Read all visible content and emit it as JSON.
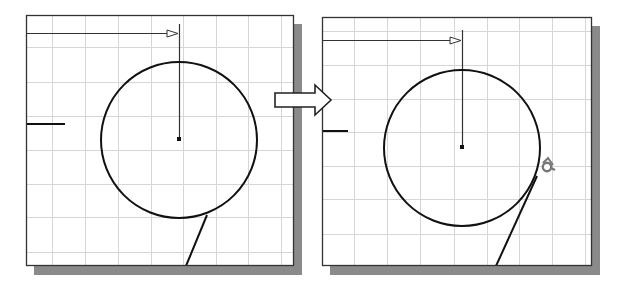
{
  "figure": {
    "colors": {
      "background": "#ffffff",
      "frame": "#333333",
      "shadow": "#8a8a8a",
      "grid": "#d6d6d6",
      "geometry": "#111111",
      "cursor": "#777777"
    },
    "panels": [
      {
        "id": "before",
        "frame": {
          "x": 26,
          "y": 15,
          "w": 268,
          "h": 251
        },
        "grid_x": [
          52,
          85,
          118,
          151,
          183,
          216,
          248,
          281
        ],
        "grid_y": [
          47,
          82,
          116,
          150,
          184,
          217,
          252
        ],
        "circle": {
          "cx": 179,
          "cy": 140,
          "r": 78
        },
        "center_point": {
          "x": 179,
          "y": 139
        },
        "leader": {
          "y": 33,
          "x1": 26,
          "x2": 179,
          "vertical_top": 24
        },
        "edge_line": {
          "y": 124,
          "x1": 26,
          "x2": 65
        },
        "tangent_line": {
          "x1": 207,
          "y1": 215,
          "x2": 186,
          "y2": 266
        },
        "cursor": null
      },
      {
        "id": "after",
        "frame": {
          "x": 322,
          "y": 17,
          "w": 270,
          "h": 249
        },
        "grid_x": [
          354,
          387,
          420,
          454,
          487,
          519,
          552,
          585
        ],
        "grid_y": [
          31,
          65,
          99,
          132,
          166,
          199,
          234
        ],
        "circle": {
          "cx": 462,
          "cy": 148,
          "r": 78
        },
        "center_point": {
          "x": 462,
          "y": 147
        },
        "leader": {
          "y": 40,
          "x1": 322,
          "x2": 462,
          "vertical_top": 30
        },
        "edge_line": {
          "y": 131,
          "x1": 322,
          "x2": 348
        },
        "tangent_line": {
          "x1": 537,
          "y1": 176,
          "x2": 496,
          "y2": 266
        },
        "cursor": {
          "x": 547,
          "y": 167,
          "name": "tangent-snap-cursor"
        }
      }
    ],
    "transition_arrow": {
      "x": 275,
      "y": 85,
      "w": 56,
      "h": 30
    }
  }
}
